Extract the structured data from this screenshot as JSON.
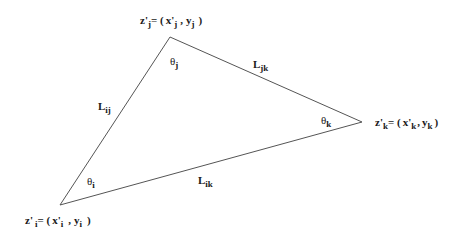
{
  "diagram": {
    "type": "triangle",
    "stroke_color": "#555555",
    "vertices": [
      {
        "id": "i",
        "x": 60,
        "y": 205,
        "label": "z'",
        "index": "i",
        "equals": "= (",
        "x_sym": "x'",
        "y_sym": "y",
        "close": ")"
      },
      {
        "id": "j",
        "x": 170,
        "y": 37,
        "label": "z'",
        "index": "j",
        "equals": "= (",
        "x_sym": "x'",
        "y_sym": "y",
        "close": ")"
      },
      {
        "id": "k",
        "x": 362,
        "y": 122,
        "label": "z'",
        "index": "k",
        "equals": "= (",
        "x_sym": "x'",
        "y_sym": "y",
        "close": ")"
      }
    ],
    "angles": [
      {
        "id": "theta-i",
        "symbol": "θ",
        "index": "i"
      },
      {
        "id": "theta-j",
        "symbol": "θ",
        "index": "j"
      },
      {
        "id": "theta-k",
        "symbol": "θ",
        "index": "k"
      }
    ],
    "edges": [
      {
        "id": "L-ij",
        "symbol": "L",
        "index": "ij"
      },
      {
        "id": "L-jk",
        "symbol": "L",
        "index": "jk"
      },
      {
        "id": "L-ik",
        "symbol": "L",
        "index": "ik"
      }
    ],
    "comma": ","
  }
}
